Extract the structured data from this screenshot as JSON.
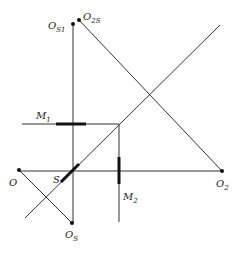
{
  "diagram": {
    "width": 240,
    "height": 255,
    "colors": {
      "line": "#333333",
      "thick": "#111111",
      "text": "#222222",
      "background": "#ffffff"
    },
    "points": {
      "O": {
        "x": 19,
        "y": 170
      },
      "O2": {
        "x": 222,
        "y": 171
      },
      "OS": {
        "x": 72,
        "y": 223
      },
      "OS1": {
        "x": 73,
        "y": 24
      },
      "O2S": {
        "x": 79,
        "y": 20
      },
      "S": {
        "x": 70,
        "y": 173
      },
      "corner": {
        "x": 119,
        "y": 124
      }
    },
    "lines": [
      {
        "id": "horizontal-axis",
        "x1": 19,
        "y1": 171,
        "x2": 222,
        "y2": 171
      },
      {
        "id": "vertical-axis",
        "x1": 73,
        "y1": 24,
        "x2": 73,
        "y2": 223
      },
      {
        "id": "main-diagonal",
        "x1": 25,
        "y1": 218,
        "x2": 220,
        "y2": 25
      },
      {
        "id": "o2s-to-o2",
        "x1": 79,
        "y1": 20,
        "x2": 222,
        "y2": 171
      },
      {
        "id": "o-to-os",
        "x1": 19,
        "y1": 170,
        "x2": 72,
        "y2": 223
      },
      {
        "id": "m1-line",
        "x1": 22,
        "y1": 124,
        "x2": 119,
        "y2": 124
      },
      {
        "id": "m2-line",
        "x1": 119,
        "y1": 124,
        "x2": 119,
        "y2": 222
      }
    ],
    "segments": [
      {
        "id": "m1-mirror",
        "x1": 56,
        "y1": 124,
        "x2": 86,
        "y2": 124
      },
      {
        "id": "m2-mirror",
        "x1": 119,
        "y1": 157,
        "x2": 119,
        "y2": 184
      },
      {
        "id": "s-splitter",
        "x1": 61,
        "y1": 182,
        "x2": 79,
        "y2": 164
      }
    ],
    "labels": {
      "OS1": {
        "main": "O",
        "sub": "S1",
        "x": 48,
        "y": 29
      },
      "O2S": {
        "main": "O",
        "sub": "2S",
        "x": 83,
        "y": 20
      },
      "M1": {
        "main": "M",
        "sub": "1",
        "x": 36,
        "y": 119
      },
      "O": {
        "main": "O",
        "sub": "",
        "x": 9,
        "y": 186
      },
      "S": {
        "main": "S",
        "sub": "",
        "x": 53,
        "y": 183
      },
      "M2": {
        "main": "M",
        "sub": "2",
        "x": 123,
        "y": 200
      },
      "O2": {
        "main": "O",
        "sub": "2",
        "x": 216,
        "y": 187
      },
      "OS": {
        "main": "O",
        "sub": "S",
        "x": 65,
        "y": 238
      }
    }
  }
}
